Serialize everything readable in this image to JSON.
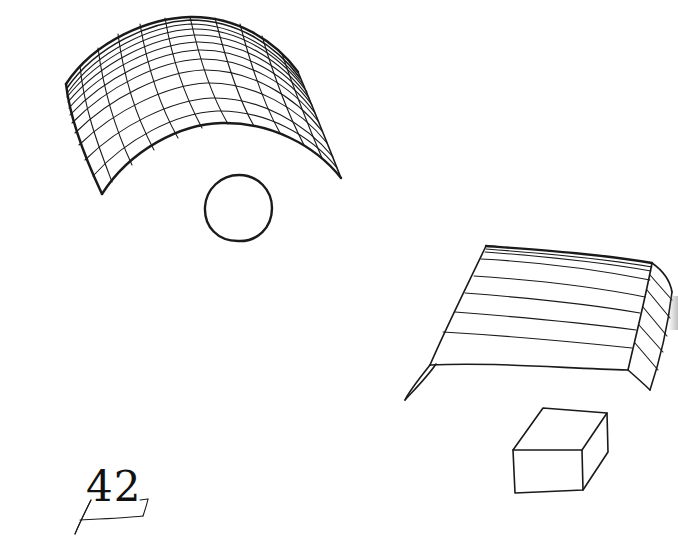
{
  "figure": {
    "type": "hand-drawn illustration of 3D geometric shapes",
    "ink_color": "#1a1a1a",
    "background": "#ffffff",
    "shapes": [
      {
        "id": "curved-grid-surface",
        "description": "Cylindrical curved sheet drawn with a wireframe grid"
      },
      {
        "id": "circle",
        "description": "Single hand-drawn circle below the curved surface"
      },
      {
        "id": "folded-sheet",
        "description": "Flat-topped folded sheet with horizontal lines and a bent right side"
      },
      {
        "id": "rectangular-box",
        "description": "Simple cuboid drawn in perspective"
      }
    ]
  },
  "page_number": {
    "text": "42"
  }
}
